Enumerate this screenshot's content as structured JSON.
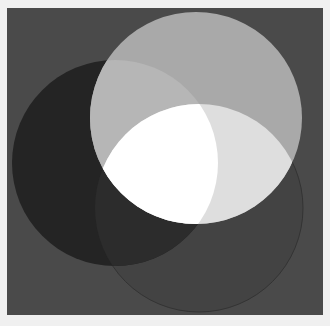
{
  "image": {
    "description": "Three overlapping circles on a dark gray square",
    "colors": {
      "border": "#f0f0f0",
      "background": "#4a4a4a",
      "top_circle": "#a9a9a9",
      "left_circle": "#242424",
      "bottom_circle": "#434343",
      "top_left_overlap": "#b6b6b6",
      "top_bottom_overlap": "#dedede",
      "left_bottom_overlap": "#2c2c2c",
      "center_overlap": "#ffffff"
    },
    "circles": [
      {
        "name": "top",
        "cx": 196,
        "cy": 118,
        "r": 106
      },
      {
        "name": "left",
        "cx": 115,
        "cy": 163,
        "r": 103
      },
      {
        "name": "bottom",
        "cx": 199,
        "cy": 208,
        "r": 104
      }
    ]
  }
}
